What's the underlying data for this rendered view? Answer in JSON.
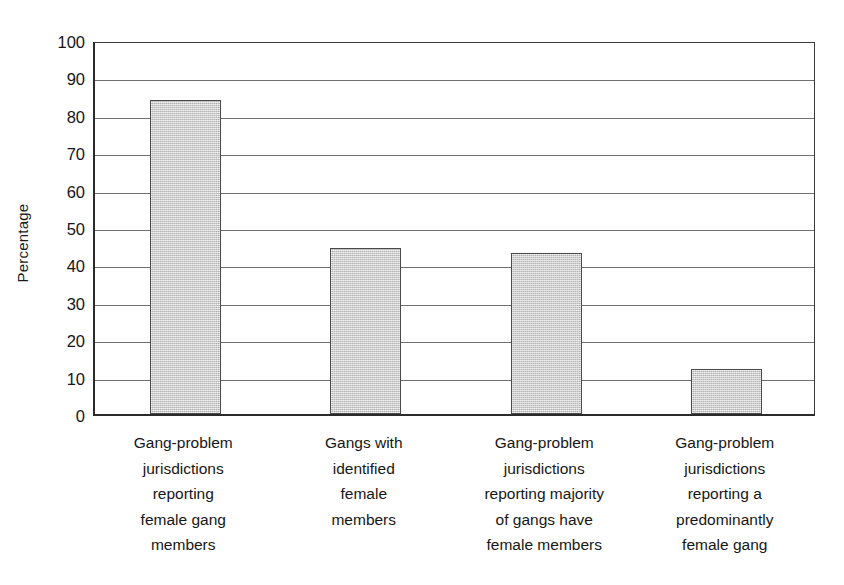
{
  "chart_data": {
    "type": "bar",
    "title": "",
    "subtitle": "",
    "xlabel": "",
    "ylabel": "Percentage",
    "ylim": [
      0,
      100
    ],
    "ytick_labels": [
      "100",
      "90",
      "80",
      "70",
      "60",
      "50",
      "40",
      "30",
      "20",
      "10",
      "0"
    ],
    "ytick_values": [
      100,
      90,
      80,
      70,
      60,
      50,
      40,
      30,
      20,
      10,
      0
    ],
    "grid": true,
    "legend": false,
    "legend_position": "none",
    "bar_fill_color": "#c9c9c9",
    "bar_border_color": "#4a4a4a",
    "axis_color": "#2b2b2b",
    "gridline_color": "#6f6f6f",
    "background_color": "#ffffff",
    "categories": [
      "Gang-problem jurisdictions reporting female gang members",
      "Gangs with identified female members",
      "Gang-problem jurisdictions reporting majority of gangs have female members",
      "Gang-problem jurisdictions reporting a predominantly female gang"
    ],
    "category_lines": [
      [
        "Gang-problem",
        "jurisdictions",
        "reporting",
        "female gang",
        "members"
      ],
      [
        "Gangs with",
        "identified",
        "female",
        "members"
      ],
      [
        "Gang-problem",
        "jurisdictions",
        "reporting majority",
        "of gangs have",
        "female members"
      ],
      [
        "Gang-problem",
        "jurisdictions",
        "reporting a",
        "predominantly",
        "female gang"
      ]
    ],
    "values": [
      84,
      44.5,
      43,
      12
    ]
  }
}
